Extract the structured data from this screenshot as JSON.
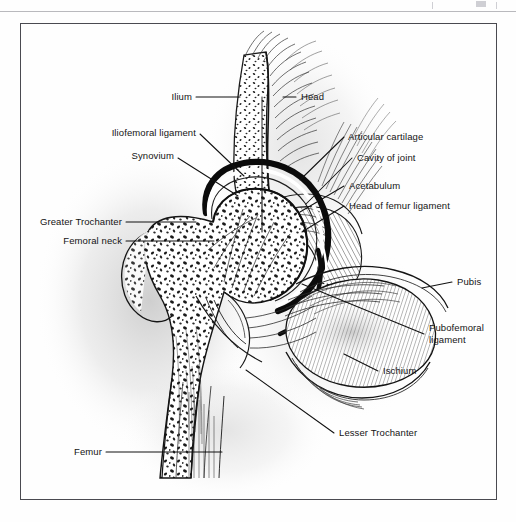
{
  "figure": {
    "frame_color": "#4a4a50",
    "background": "#fefefe",
    "ink_color": "#141414"
  },
  "labels": {
    "ilium": "Ilium",
    "head": "Head",
    "iliofemoral_ligament": "Iliofemoral ligament",
    "synovium": "Synovium",
    "articular_cartilage": "Articular cartilage",
    "cavity_of_joint": "Cavity of joint",
    "acetabulum": "Acetabulum",
    "head_of_femur_ligament": "Head of femur ligament",
    "greater_trochanter": "Greater Trochanter",
    "femoral_neck": "Femoral neck",
    "pubis": "Pubis",
    "pubofemoral_ligament": "Pubofemoral ligament",
    "ischium": "Ischium",
    "lesser_trochanter": "Lesser Trochanter",
    "femur": "Femur"
  }
}
